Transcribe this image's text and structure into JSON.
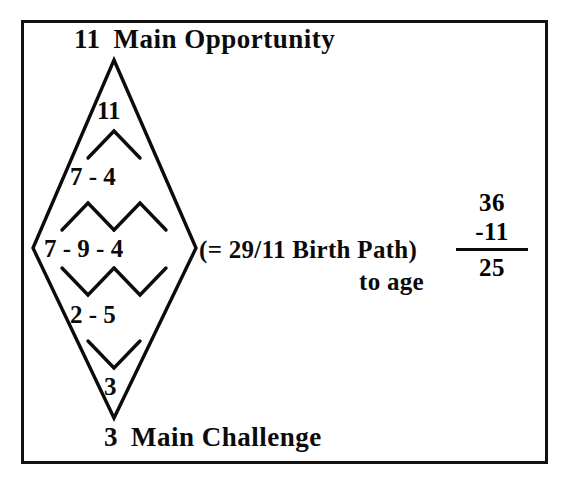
{
  "diagram": {
    "type": "numerology-pyramid-diamond",
    "top_label": {
      "number": "11",
      "text": "Main Opportunity"
    },
    "bottom_label": {
      "number": "3",
      "text": "Main Challenge"
    },
    "rows": [
      {
        "name": "apex-row",
        "values": [
          "11"
        ]
      },
      {
        "name": "second-row",
        "values": [
          "7",
          "4"
        ]
      },
      {
        "name": "base-row",
        "values": [
          "7",
          "9",
          "4"
        ]
      },
      {
        "name": "fourth-row",
        "values": [
          "2",
          "5"
        ]
      },
      {
        "name": "bottom-row",
        "values": [
          "3"
        ]
      }
    ],
    "row_text": {
      "apex": "11",
      "second": "7 - 4",
      "base": "7 - 9 - 4",
      "fourth": "2 - 5",
      "bottom": "3"
    },
    "separator": "-"
  },
  "annotations": {
    "birth_path": "(= 29/11 Birth Path)",
    "to_age": "to age"
  },
  "calculation": {
    "minuend": "36",
    "subtrahend": "-11",
    "result": "25"
  },
  "colors": {
    "ink": "#0b0b0b",
    "frame": "#111111",
    "background": "#ffffff"
  }
}
